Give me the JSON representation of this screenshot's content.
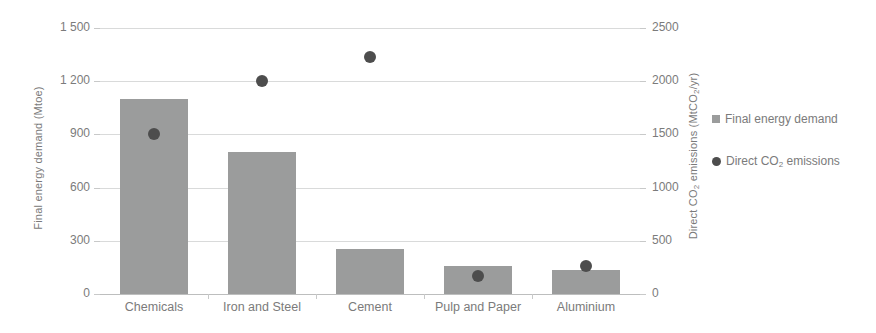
{
  "chart_data": {
    "type": "bar",
    "title": "",
    "categories": [
      "Chemicals",
      "Iron and Steel",
      "Cement",
      "Pulp and Paper",
      "Aluminium"
    ],
    "series": [
      {
        "name": "Final energy demand",
        "axis": "left",
        "unit": "Mtoe",
        "marker": "square",
        "color": "#9b9c9c",
        "values": [
          1100,
          800,
          255,
          160,
          135
        ]
      },
      {
        "name": "Direct CO2 emissions",
        "axis": "right",
        "unit": "MtCO2/yr",
        "marker": "circle",
        "color": "#4d4d4d",
        "values": [
          1500,
          2000,
          2225,
          170,
          260
        ]
      }
    ],
    "xlabel": "",
    "ylabel": "Final energy demand (Mtoe)",
    "y2label": "Direct CO2 emissions (MtCO2/yr)",
    "ylim": [
      0,
      1500
    ],
    "y2lim": [
      0,
      2500
    ],
    "yticks": [
      0,
      300,
      600,
      900,
      1200,
      1500
    ],
    "y2ticks": [
      0,
      500,
      1000,
      1500,
      2000,
      2500
    ],
    "grid": true,
    "legend_position": "right"
  },
  "axes": {
    "left": {
      "title_main": "Final energy demand (Mtoe)",
      "title_prefix": "Final energy demand (Mtoe)",
      "ticks": [
        "1 500",
        "1 200",
        "900",
        "600",
        "300",
        "0"
      ]
    },
    "right": {
      "title_prefix": "Direct CO",
      "title_sub1": "2",
      "title_mid": " emissions (MtCO",
      "title_sub2": "2",
      "title_suffix": "/yr)",
      "ticks": [
        "2500",
        "2000",
        "1500",
        "1000",
        "500",
        "0"
      ]
    },
    "categories": [
      "Chemicals",
      "Iron and Steel",
      "Cement",
      "Pulp and Paper",
      "Aluminium"
    ]
  },
  "legend": {
    "items": [
      {
        "label_prefix": "Final energy demand",
        "label_sub": "",
        "label_suffix": "",
        "marker": "square",
        "color": "#9b9c9c"
      },
      {
        "label_prefix": "Direct CO",
        "label_sub": "2",
        "label_suffix": " emissions",
        "marker": "circle",
        "color": "#4d4d4d"
      }
    ]
  },
  "colors": {
    "bar": "#9b9c9c",
    "dot": "#4d4d4d",
    "gridline": "#d9dada",
    "axis_text": "#7b7b7b",
    "background": "#ffffff"
  }
}
